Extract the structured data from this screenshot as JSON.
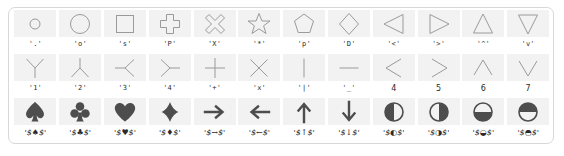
{
  "figure": {
    "title": "",
    "background": "#ffffff",
    "frame_color": "#d8d8d8",
    "swatch_color": "#f2f2f2",
    "outline_marker_color": "#9a9a9a",
    "filled_marker_color": "#4d4d4d"
  },
  "chart_data": {
    "type": "table",
    "title": "",
    "subtitle": "",
    "xlabel": "",
    "ylabel": "",
    "grid": false,
    "legend": "none",
    "rows": 3,
    "columns": 12,
    "categories": [
      "'.'",
      "'o'",
      "'s'",
      "'P'",
      "'X'",
      "'*'",
      "'p'",
      "'D'",
      "'<'",
      "'>'",
      "'^'",
      "'v'",
      "'1'",
      "'2'",
      "'3'",
      "'4'",
      "'+'",
      "'x'",
      "'|'",
      "'_'",
      "4",
      "5",
      "6",
      "7",
      "'$\\spadesuit$'",
      "'$\\clubsuit$'",
      "'$\\heartsuit$'",
      "'$\\diamondsuit$'",
      "'$\\rightarrow$'",
      "'$\\leftarrow$'",
      "'$\\uparrow$'",
      "'$\\downarrow$'",
      "'$\\circlelefthalf$'",
      "'$\\circlerighthalf$'",
      "'$\\circledownhalf$'",
      "'$\\circleuphalf$'"
    ],
    "values": [
      1,
      1,
      1,
      1,
      1,
      1,
      1,
      1,
      1,
      1,
      1,
      1,
      1,
      1,
      1,
      1,
      1,
      1,
      1,
      1,
      1,
      1,
      1,
      1,
      1,
      1,
      1,
      1,
      1,
      1,
      1,
      1,
      1,
      1,
      1,
      1
    ]
  },
  "markers": {
    "row1": [
      {
        "code": "point",
        "label": "'.'",
        "style": "mono"
      },
      {
        "code": "circle",
        "label": "'o'",
        "style": "mono"
      },
      {
        "code": "square",
        "label": "'s'",
        "style": "mono"
      },
      {
        "code": "plus-filled",
        "label": "'P'",
        "style": "mono"
      },
      {
        "code": "x-filled",
        "label": "'X'",
        "style": "mono"
      },
      {
        "code": "star",
        "label": "'*'",
        "style": "mono"
      },
      {
        "code": "pentagon",
        "label": "'p'",
        "style": "mono"
      },
      {
        "code": "diamond",
        "label": "'D'",
        "style": "mono"
      },
      {
        "code": "triangle-left",
        "label": "'<'",
        "style": "mono"
      },
      {
        "code": "triangle-right",
        "label": "'>'",
        "style": "mono"
      },
      {
        "code": "triangle-up",
        "label": "'^'",
        "style": "mono"
      },
      {
        "code": "triangle-down",
        "label": "'v'",
        "style": "mono"
      }
    ],
    "row2": [
      {
        "code": "tri-down",
        "label": "'1'",
        "style": "mono"
      },
      {
        "code": "tri-up",
        "label": "'2'",
        "style": "mono"
      },
      {
        "code": "tri-left",
        "label": "'3'",
        "style": "mono"
      },
      {
        "code": "tri-right",
        "label": "'4'",
        "style": "mono"
      },
      {
        "code": "plus",
        "label": "'+'",
        "style": "mono"
      },
      {
        "code": "x",
        "label": "'x'",
        "style": "mono"
      },
      {
        "code": "vline",
        "label": "'|'",
        "style": "mono"
      },
      {
        "code": "hline",
        "label": "'_'",
        "style": "mono"
      },
      {
        "code": "caretleft",
        "label": "4",
        "style": "num"
      },
      {
        "code": "caretright",
        "label": "5",
        "style": "num"
      },
      {
        "code": "caretup",
        "label": "6",
        "style": "num"
      },
      {
        "code": "caretdown",
        "label": "7",
        "style": "num"
      }
    ],
    "row3": [
      {
        "code": "spadesuit",
        "label": "'$\\spadesuit$'",
        "style": "math",
        "display": "'$♠$'"
      },
      {
        "code": "clubsuit",
        "label": "'$\\clubsuit$'",
        "style": "math",
        "display": "'$♣$'"
      },
      {
        "code": "heartsuit",
        "label": "'$\\heartsuit$'",
        "style": "math",
        "display": "'$♥$'"
      },
      {
        "code": "diamondsuit",
        "label": "'$\\diamondsuit$'",
        "style": "math",
        "display": "'$♦$'"
      },
      {
        "code": "rightarrow",
        "label": "'$\\rightarrow$'",
        "style": "math",
        "display": "'$→$'"
      },
      {
        "code": "leftarrow",
        "label": "'$\\leftarrow$'",
        "style": "math",
        "display": "'$←$'"
      },
      {
        "code": "uparrow",
        "label": "'$\\uparrow$'",
        "style": "math",
        "display": "'$↑$'"
      },
      {
        "code": "downarrow",
        "label": "'$\\downarrow$'",
        "style": "math",
        "display": "'$↓$'"
      },
      {
        "code": "circle-left-half",
        "label": "'$\\circlelefthalf$'",
        "style": "math",
        "display": "'$◐$'"
      },
      {
        "code": "circle-right-half",
        "label": "'$\\circlerighthalf$'",
        "style": "math",
        "display": "'$◑$'"
      },
      {
        "code": "circle-down-half",
        "label": "'$\\circledownhalf$'",
        "style": "math",
        "display": "'$◒$'"
      },
      {
        "code": "circle-up-half",
        "label": "'$\\circleuphalf$'",
        "style": "math",
        "display": "'$◓$'"
      }
    ]
  }
}
